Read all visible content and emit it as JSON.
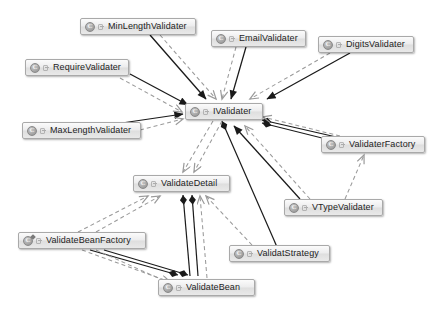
{
  "diagram": {
    "background_color": "#ffffff",
    "node_fill_color": "#e9e9e9",
    "node_border_color": "#a9a9a9",
    "edge_solid_color": "#1a1a1a",
    "edge_dashed_color": "#9a9a9a",
    "nodes": [
      {
        "id": "minlength",
        "label": "MinLengthValidater",
        "icon": "class-icon",
        "x": 80,
        "y": 18,
        "width": 116
      },
      {
        "id": "email",
        "label": "EmailValidater",
        "icon": "class-icon",
        "x": 211,
        "y": 30,
        "width": 95
      },
      {
        "id": "digits",
        "label": "DigitsValidater",
        "icon": "class-icon",
        "x": 318,
        "y": 36,
        "width": 96
      },
      {
        "id": "require",
        "label": "RequireValidater",
        "icon": "class-icon",
        "x": 25,
        "y": 59,
        "width": 104
      },
      {
        "id": "ivalidater",
        "label": "IValidater",
        "icon": "class-icon",
        "x": 185,
        "y": 103,
        "width": 78
      },
      {
        "id": "maxlength",
        "label": "MaxLengthValidater",
        "icon": "class-icon",
        "x": 22,
        "y": 122,
        "width": 119
      },
      {
        "id": "factory",
        "label": "ValidaterFactory",
        "icon": "class-icon",
        "x": 321,
        "y": 136,
        "width": 104
      },
      {
        "id": "detail",
        "label": "ValidateDetail",
        "icon": "class-icon",
        "x": 133,
        "y": 175,
        "width": 97
      },
      {
        "id": "vtype",
        "label": "VTypeValidater",
        "icon": "class-icon",
        "x": 284,
        "y": 199,
        "width": 99
      },
      {
        "id": "beanfactory",
        "label": "ValidateBeanFactory",
        "icon": "class-icon-decorated",
        "x": 18,
        "y": 232,
        "width": 128
      },
      {
        "id": "strategy",
        "label": "ValidatStrategy",
        "icon": "class-icon",
        "x": 229,
        "y": 245,
        "width": 101
      },
      {
        "id": "bean",
        "label": "ValidateBean",
        "icon": "class-icon",
        "x": 158,
        "y": 279,
        "width": 97
      }
    ],
    "edge_types": {
      "inheritance": "solid line with filled triangle arrowhead",
      "dependency": "dashed line with open arrowhead",
      "composition": "solid line with filled diamond"
    },
    "edges": [
      {
        "from": "minlength",
        "to": "ivalidater",
        "type": "inheritance"
      },
      {
        "from": "minlength",
        "to": "ivalidater",
        "type": "dependency"
      },
      {
        "from": "email",
        "to": "ivalidater",
        "type": "inheritance"
      },
      {
        "from": "email",
        "to": "ivalidater",
        "type": "dependency"
      },
      {
        "from": "digits",
        "to": "ivalidater",
        "type": "inheritance"
      },
      {
        "from": "digits",
        "to": "ivalidater",
        "type": "dependency"
      },
      {
        "from": "require",
        "to": "ivalidater",
        "type": "inheritance"
      },
      {
        "from": "require",
        "to": "ivalidater",
        "type": "dependency"
      },
      {
        "from": "maxlength",
        "to": "ivalidater",
        "type": "inheritance"
      },
      {
        "from": "maxlength",
        "to": "ivalidater",
        "type": "dependency"
      },
      {
        "from": "vtype",
        "to": "ivalidater",
        "type": "inheritance"
      },
      {
        "from": "vtype",
        "to": "ivalidater",
        "type": "dependency"
      },
      {
        "from": "vtype",
        "to": "factory",
        "type": "dependency"
      },
      {
        "from": "factory",
        "to": "ivalidater",
        "type": "composition"
      },
      {
        "from": "factory",
        "to": "ivalidater",
        "type": "dependency"
      },
      {
        "from": "strategy",
        "to": "ivalidater",
        "type": "composition"
      },
      {
        "from": "strategy",
        "to": "detail",
        "type": "dependency"
      },
      {
        "from": "ivalidater",
        "to": "detail",
        "type": "dependency"
      },
      {
        "from": "beanfactory",
        "to": "detail",
        "type": "dependency"
      },
      {
        "from": "beanfactory",
        "to": "bean",
        "type": "composition"
      },
      {
        "from": "beanfactory",
        "to": "bean",
        "type": "dependency"
      },
      {
        "from": "bean",
        "to": "detail",
        "type": "composition"
      },
      {
        "from": "bean",
        "to": "detail",
        "type": "dependency"
      }
    ]
  }
}
